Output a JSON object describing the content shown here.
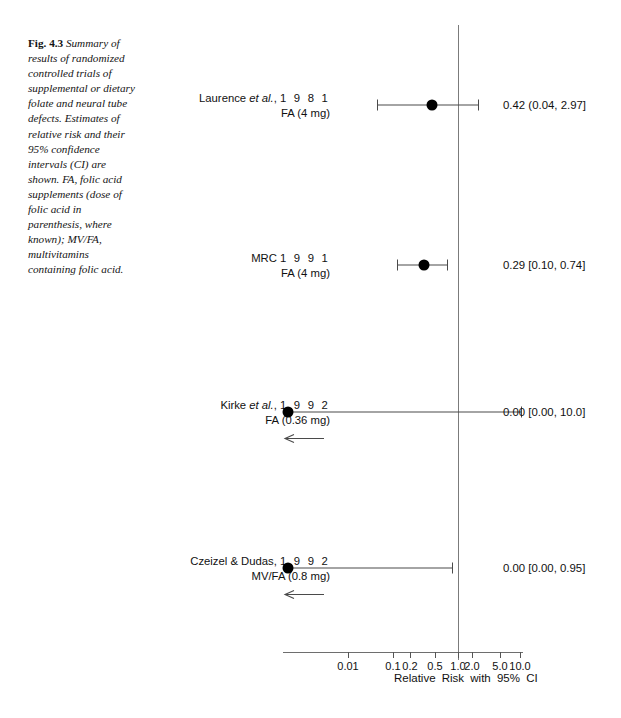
{
  "figure": {
    "number": "Fig. 4.3",
    "caption": "Summary of results of randomized controlled trials of supplemental or dietary folate and neural tube defects. Estimates of relative risk and their 95% confidence intervals (CI) are shown. FA, folic acid supplements (dose of folic acid in parenthesis, where known); MV/FA, multivitamins containing folic acid."
  },
  "chart_data": {
    "type": "forest",
    "title": "",
    "xlabel": "Relative Risk with 95% CI",
    "ylabel": "",
    "xscale": "log",
    "xlim": [
      0.01,
      10.0
    ],
    "reference_line": 1.0,
    "grid": false,
    "tick_labels": [
      "0.01",
      "0.1",
      "0.2",
      "0.5",
      "1.0",
      "2.0",
      "5.0",
      "10.0"
    ],
    "tick_values": [
      0.01,
      0.1,
      0.2,
      0.5,
      1.0,
      2.0,
      5.0,
      10.0
    ],
    "tick_x_px": [
      348,
      393,
      410,
      435,
      458,
      472,
      500,
      520
    ],
    "axis_x_start_px": 283,
    "axis_x_end_px": 523,
    "studies": [
      {
        "name": "Laurence et al., 1 9 8 1",
        "author": "Laurence",
        "etal": "et al.",
        "year": "1 9 8 1",
        "treatment": "FA (4 mg)",
        "estimate": 0.42,
        "ci_low": 0.04,
        "ci_high": 2.97,
        "stat_text": "0.42 (0.04, 2.97]",
        "truncated_left": false,
        "row_y_px": 105,
        "point_x_px": 432,
        "bar_left_px": 377,
        "bar_right_px": 478
      },
      {
        "name": "MRC 1 9 9 1",
        "author": "MRC",
        "etal": "",
        "year": "1 9 9 1",
        "treatment": "FA (4 mg)",
        "estimate": 0.29,
        "ci_low": 0.1,
        "ci_high": 0.74,
        "stat_text": "0.29 [0.10, 0.74]",
        "truncated_left": false,
        "row_y_px": 265,
        "point_x_px": 424,
        "bar_left_px": 397,
        "bar_right_px": 447
      },
      {
        "name": "Kirke et al., 1 9 9 2",
        "author": "Kirke",
        "etal": "et al.",
        "year": "1 9 9 2",
        "treatment": "FA (0.36 mg)",
        "estimate": 0.0,
        "ci_low": 0.0,
        "ci_high": 10.0,
        "stat_text": "0.00 [0.00, 10.0]",
        "truncated_left": true,
        "row_y_px": 412,
        "point_x_px": 288,
        "bar_left_px": 288,
        "bar_right_px": 521
      },
      {
        "name": "Czeizel & Dudas, 1 9 9 2",
        "author": "Czeizel & Dudas,",
        "etal": "",
        "year": "1 9 9 2",
        "treatment": "MV/FA (0.8 mg)",
        "estimate": 0.0,
        "ci_low": 0.0,
        "ci_high": 0.95,
        "stat_text": "0.00 [0.00, 0.95]",
        "truncated_left": true,
        "row_y_px": 568,
        "point_x_px": 288,
        "bar_left_px": 288,
        "bar_right_px": 452
      }
    ]
  },
  "colors": {
    "marker": "#000000",
    "line": "#4a4a4a",
    "reference": "#7b7b7b",
    "axis": "#6e6e6e",
    "text": "#111111"
  }
}
